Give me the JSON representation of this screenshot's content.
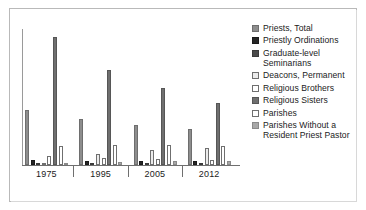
{
  "chart_data": {
    "type": "bar",
    "title": "",
    "subtitle": "",
    "xlabel": "",
    "ylabel": "",
    "grid": false,
    "legend_position": "right",
    "categories": [
      "1975",
      "1995",
      "2005",
      "2012"
    ],
    "tick_labels": [
      "1975",
      "1995",
      "2005",
      "2012"
    ],
    "ylim": [
      0,
      60000
    ],
    "series": [
      {
        "name": "Priests, Total",
        "color": "#8d8d8d",
        "border": "#6e6e6e",
        "values": [
          58909,
          49054,
          42839,
          38964
        ],
        "plot_heights": [
          55,
          46,
          40,
          36
        ]
      },
      {
        "name": "Priestly Ordinations",
        "color": "#262626",
        "border": "#1a1a1a",
        "values": [
          771,
          511,
          454,
          497
        ],
        "plot_heights": [
          5,
          4,
          4,
          4
        ]
      },
      {
        "name": "Graduate-level Seminarians",
        "color": "#4a4a4a",
        "border": "#3a3a3a",
        "values": [
          5279,
          3172,
          3308,
          3723
        ],
        "plot_heights": [
          2,
          2,
          2,
          2
        ]
      },
      {
        "name": "Deacons, Permanent",
        "color": "#ebebeb",
        "border": "#6f6f6f",
        "values": [
          898,
          10932,
          15018,
          17464
        ],
        "plot_heights": [
          2,
          11,
          15,
          17
        ]
      },
      {
        "name": "Religious Brothers",
        "color": "#ffffff",
        "border": "#6f6f6f",
        "values": [
          8625,
          6535,
          5451,
          4441
        ],
        "plot_heights": [
          9,
          7,
          6,
          5
        ]
      },
      {
        "name": "Religious Sisters",
        "color": "#6f6f6f",
        "border": "#565656",
        "values": [
          135225,
          92107,
          68634,
          54018
        ],
        "plot_heights": [
          128,
          95,
          77,
          62
        ]
      },
      {
        "name": "Parishes",
        "color": "#ffffff",
        "border": "#6f6f6f",
        "values": [
          18515,
          19331,
          18891,
          17644
        ],
        "plot_heights": [
          19,
          20,
          20,
          19
        ]
      },
      {
        "name": "Parishes Without a Resident Priest Pastor",
        "color": "#a8a8a8",
        "border": "#8a8a8a",
        "values": [
          702,
          2161,
          3251,
          3496
        ],
        "plot_heights": [
          2,
          3,
          4,
          4
        ]
      }
    ]
  },
  "legend": {
    "items": [
      {
        "label": "Priests, Total",
        "swatch_name": "legend-swatch-priests-total"
      },
      {
        "label": "Priestly Ordinations",
        "swatch_name": "legend-swatch-priestly-ordinations"
      },
      {
        "label": "Graduate-level Seminarians",
        "swatch_name": "legend-swatch-graduate-level-seminarians"
      },
      {
        "label": "Deacons, Permanent",
        "swatch_name": "legend-swatch-deacons-permanent"
      },
      {
        "label": "Religious Brothers",
        "swatch_name": "legend-swatch-religious-brothers"
      },
      {
        "label": "Religious Sisters",
        "swatch_name": "legend-swatch-religious-sisters"
      },
      {
        "label": "Parishes",
        "swatch_name": "legend-swatch-parishes"
      },
      {
        "label": "Parishes Without a Resident Priest Pastor",
        "swatch_name": "legend-swatch-parishes-without-resident-priest-pastor"
      }
    ]
  },
  "colors": {
    "frame_border": "#b9b9b9",
    "axis": "#6f6f6f",
    "background": "#ffffff",
    "text": "#1b1b1b"
  }
}
